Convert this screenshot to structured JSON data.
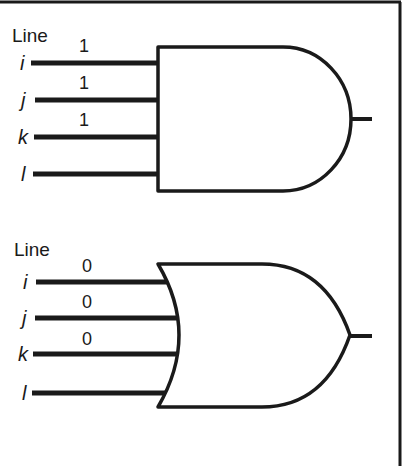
{
  "diagram": {
    "type": "logic-gates",
    "colors": {
      "ink": "#1a1a1a",
      "background": "#ffffff"
    },
    "gates": [
      {
        "gate_type": "AND",
        "heading": "Line",
        "inputs": [
          {
            "name": "i",
            "value": "1"
          },
          {
            "name": "j",
            "value": "1"
          },
          {
            "name": "k",
            "value": "1"
          },
          {
            "name": "l",
            "value": ""
          }
        ]
      },
      {
        "gate_type": "OR",
        "heading": "Line",
        "inputs": [
          {
            "name": "i",
            "value": "0"
          },
          {
            "name": "j",
            "value": "0"
          },
          {
            "name": "k",
            "value": "0"
          },
          {
            "name": "l",
            "value": ""
          }
        ]
      }
    ]
  }
}
